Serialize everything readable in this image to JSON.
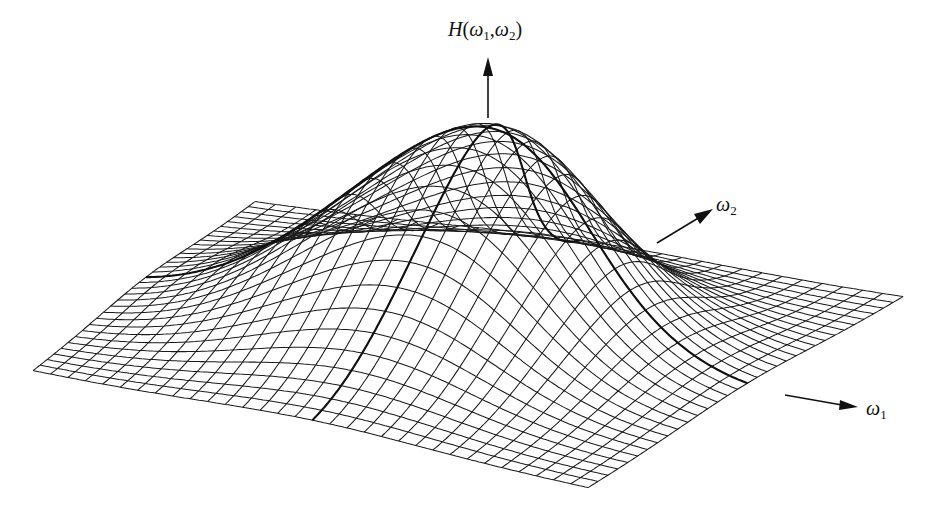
{
  "chart_data": {
    "type": "surface3d",
    "title": "",
    "function": "2D Gaussian frequency response H(ω1,ω2)",
    "axes": {
      "z": {
        "label": "H(ω1,ω2)",
        "symbol": "H",
        "args": [
          "ω",
          "1",
          "ω",
          "2"
        ]
      },
      "x": {
        "label": "ω1",
        "symbol": "ω",
        "sub": "1"
      },
      "y": {
        "label": "ω2",
        "symbol": "ω",
        "sub": "2"
      }
    },
    "grid": {
      "rows": 32,
      "cols": 32,
      "style": "wireframe"
    },
    "peak": {
      "omega1": 0,
      "omega2": 0,
      "value": 1.0
    },
    "sigma_relative": 0.2,
    "ticks": [],
    "legend": []
  },
  "labels": {
    "z_axis": {
      "main": "H",
      "open": "(",
      "w": "ω",
      "s1": "1",
      "comma": ",",
      "s2": "2",
      "close": ")"
    },
    "w2_axis": {
      "w": "ω",
      "sub": "2"
    },
    "w1_axis": {
      "w": "ω",
      "sub": "1"
    }
  },
  "colors": {
    "line": "#1a1a1a",
    "background": "#ffffff"
  }
}
